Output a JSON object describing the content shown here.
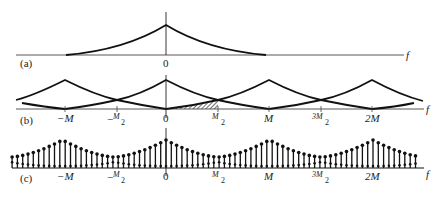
{
  "figure": {
    "axis_variable": "f",
    "ticks": [
      {
        "pos": -1.0,
        "label": "-M"
      },
      {
        "pos": -0.5,
        "label": "-M/2"
      },
      {
        "pos": 0.0,
        "label": "0"
      },
      {
        "pos": 0.5,
        "label": "M/2"
      },
      {
        "pos": 1.0,
        "label": "M"
      },
      {
        "pos": 1.5,
        "label": "3M/2"
      },
      {
        "pos": 2.0,
        "label": "2M"
      }
    ],
    "panels": [
      {
        "id": "a",
        "label": "(a)",
        "type": "continuous single spectrum",
        "center_label": "0",
        "axis_label": "f"
      },
      {
        "id": "b",
        "label": "(b)",
        "type": "periodic repeated spectra with overlap (aliasing) hatched between 0 and M/2",
        "axis_label": "f"
      },
      {
        "id": "c",
        "label": "(c)",
        "type": "discrete stem samples of periodic spectrum",
        "axis_label": "f"
      }
    ]
  },
  "labels": {
    "a": "(a)",
    "b": "(b)",
    "c": "(c)",
    "f": "f",
    "zero": "0",
    "negM": "−M",
    "negHalfM_M": "M",
    "negHalfM_2": "2",
    "halfM_M": "M",
    "halfM_2": "2",
    "M": "M",
    "threeHalfM_3M": "3M",
    "threeHalfM_2": "2",
    "twoM": "2M",
    "minus": "−"
  }
}
